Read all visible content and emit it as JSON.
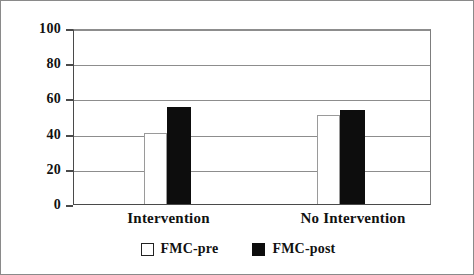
{
  "figure": {
    "background_color": "#ffffff",
    "border_color": "#8a8a8a"
  },
  "chart_data": {
    "type": "bar",
    "title": "",
    "subtitle": "",
    "xlabel": "",
    "ylabel": "",
    "categories": [
      "Intervention",
      "No Intervention"
    ],
    "series": [
      {
        "name": "FMC-pre",
        "values": [
          41,
          51
        ],
        "color": "#ffffff",
        "edge_color": "#9a9a9a"
      },
      {
        "name": "FMC-post",
        "values": [
          56,
          54
        ],
        "color": "#0d0d0d",
        "edge_color": "#0d0d0d"
      }
    ],
    "ylim": [
      0,
      100
    ],
    "yticks": [
      0,
      20,
      40,
      60,
      80,
      100
    ],
    "ytick_labels": [
      "0",
      "20",
      "40",
      "60",
      "80",
      "100"
    ],
    "grid": true,
    "grid_axis": "y",
    "legend_position": "bottom-center",
    "legend_entries": [
      "FMC-pre",
      "FMC-post"
    ]
  },
  "axis": {
    "y": {
      "ticks": [
        {
          "value": 100,
          "label": "100"
        },
        {
          "value": 80,
          "label": "80"
        },
        {
          "value": 60,
          "label": "60"
        },
        {
          "value": 40,
          "label": "40"
        },
        {
          "value": 20,
          "label": "20"
        },
        {
          "value": 0,
          "label": "0"
        }
      ]
    },
    "x": {
      "categories": [
        {
          "label": "Intervention"
        },
        {
          "label": "No Intervention"
        }
      ]
    }
  },
  "legend": {
    "items": [
      {
        "label": "FMC-pre",
        "swatch": "open-square-swatch"
      },
      {
        "label": "FMC-post",
        "swatch": "filled-square-swatch"
      }
    ]
  }
}
